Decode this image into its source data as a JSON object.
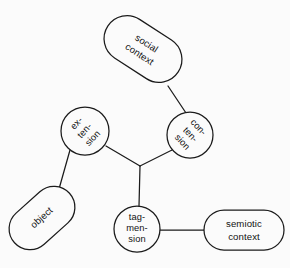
{
  "diagram": {
    "background_color": "#fbfbfb",
    "stroke_color": "#1b1b1b",
    "text_color": "#121212",
    "nodes": [
      {
        "id": "social-context",
        "shape": "stadium",
        "lines": [
          "social",
          "context"
        ],
        "line1": "social",
        "line2": "context",
        "cx": 143,
        "cy": 49,
        "width": 84,
        "height": 46,
        "rotation": 33
      },
      {
        "id": "con-tension",
        "shape": "circle",
        "lines": [
          "con-",
          "ten-",
          "sion"
        ],
        "line1": "con-",
        "line2": "ten-",
        "line3": "sion",
        "cx": 190,
        "cy": 135,
        "radius": 23,
        "rotation": 47
      },
      {
        "id": "ex-tension",
        "shape": "circle",
        "lines": [
          "ex-",
          "ten-",
          "sion"
        ],
        "line1": "ex-",
        "line2": "ten-",
        "line3": "sion",
        "cx": 85,
        "cy": 131,
        "radius": 24,
        "rotation": -47
      },
      {
        "id": "object",
        "shape": "stadium",
        "lines": [
          "object"
        ],
        "line1": "object",
        "cx": 42,
        "cy": 218,
        "width": 74,
        "height": 42,
        "rotation": -42
      },
      {
        "id": "tag-mension",
        "shape": "circle",
        "lines": [
          "tag-",
          "men-",
          "sion"
        ],
        "line1": "tag-",
        "line2": "men-",
        "line3": "sion",
        "cx": 137,
        "cy": 229,
        "radius": 23,
        "rotation": 0
      },
      {
        "id": "semiotic-context",
        "shape": "stadium",
        "lines": [
          "semiotic",
          "context"
        ],
        "line1": "semiotic",
        "line2": "context",
        "cx": 244,
        "cy": 230,
        "width": 80,
        "height": 40,
        "rotation": 0
      }
    ],
    "junction": {
      "x": 140,
      "y": 166
    },
    "edges": [
      {
        "id": "edge-social-to-contension",
        "from": "social-context",
        "to": "con-tension",
        "x1": 168,
        "y1": 86,
        "x2": 186,
        "y2": 113
      },
      {
        "id": "edge-contension-to-junction",
        "from": "con-tension",
        "to": "junction",
        "x1": 172,
        "y1": 150,
        "x2": 140,
        "y2": 166
      },
      {
        "id": "edge-extension-to-junction",
        "from": "ex-tension",
        "to": "junction",
        "x1": 106,
        "y1": 146,
        "x2": 140,
        "y2": 166
      },
      {
        "id": "edge-extension-to-object",
        "from": "ex-tension",
        "to": "object",
        "x1": 70,
        "y1": 150,
        "x2": 59,
        "y2": 189
      },
      {
        "id": "edge-junction-to-tagmension",
        "from": "junction",
        "to": "tag-mension",
        "x1": 140,
        "y1": 166,
        "x2": 139,
        "y2": 206
      },
      {
        "id": "edge-tagmension-to-semiotic",
        "from": "tag-mension",
        "to": "semiotic-context",
        "x1": 160,
        "y1": 230,
        "x2": 204,
        "y2": 230
      }
    ]
  }
}
